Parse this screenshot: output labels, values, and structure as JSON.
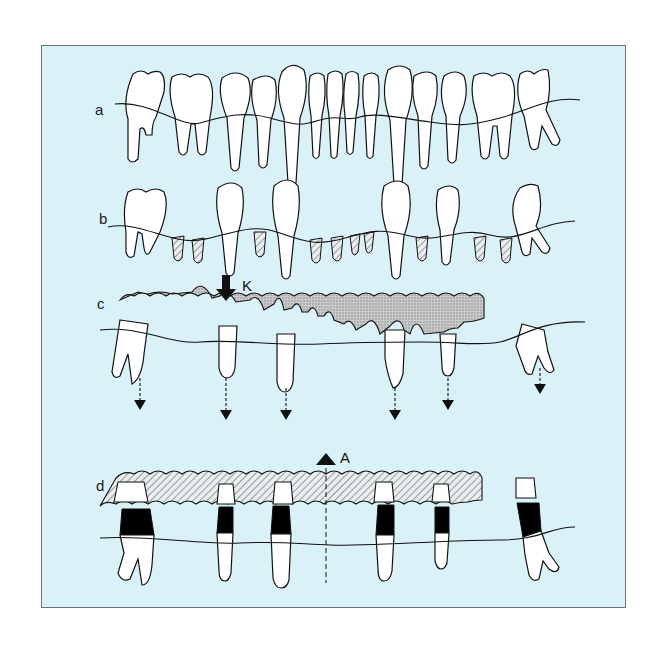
{
  "figure": {
    "background": "#dbf1f8",
    "border_color": "#6d7376",
    "ink": "#111111",
    "stipple": "#b9b9b9",
    "panels": [
      {
        "id": "a",
        "label": "a",
        "description": "Full dentition with gum line"
      },
      {
        "id": "b",
        "label": "b",
        "description": "Remaining teeth with root remnants (hatched)"
      },
      {
        "id": "c",
        "label": "c",
        "description": "Denture base (stippled) over abutment teeth; intrusion arrows"
      },
      {
        "id": "d",
        "label": "d",
        "description": "Overdenture (hatched) with copings on abutments (black)"
      }
    ],
    "markers": {
      "k": {
        "label": "K",
        "direction": "down"
      },
      "a": {
        "label": "A",
        "direction": "up"
      }
    },
    "abutment_x": [
      130,
      228,
      287,
      395,
      448,
      540
    ]
  }
}
